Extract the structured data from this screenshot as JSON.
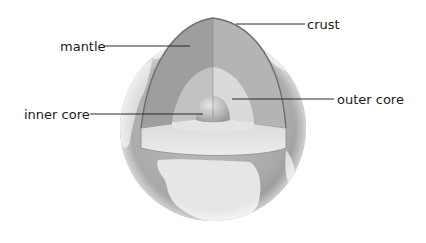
{
  "diagram": {
    "layers": [
      {
        "id": "crust",
        "label": "crust"
      },
      {
        "id": "mantle",
        "label": "mantle"
      },
      {
        "id": "outer-core",
        "label": "outer core"
      },
      {
        "id": "inner-core",
        "label": "inner core"
      }
    ],
    "colors": {
      "ocean": "#a9a9a9",
      "land": "#e4e4e4",
      "mantle_left": "#9c9c9c",
      "mantle_right": "#b3b3b3",
      "outer_core": "#d2d2d2",
      "inner_core": "#bdbdbd",
      "cut_floor": "#dcdcdc",
      "crust_edge": "#6e6e6e"
    }
  }
}
